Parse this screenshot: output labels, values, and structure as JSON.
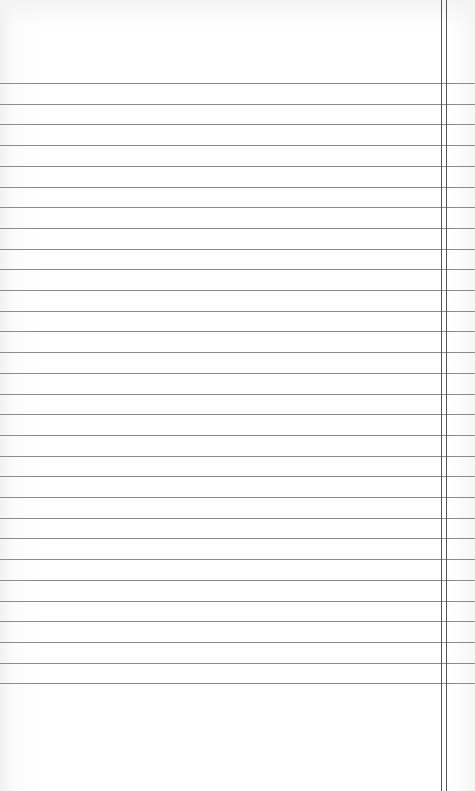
{
  "page": {
    "type": "ruled-notebook-paper",
    "background_color": "#ffffff",
    "rule_color": "#8a8a8a",
    "margin_color": "#555555"
  },
  "rules": {
    "first_y": 83,
    "spacing": 20.7,
    "count": 30
  },
  "margins": {
    "positions_x": [
      441,
      446
    ]
  }
}
